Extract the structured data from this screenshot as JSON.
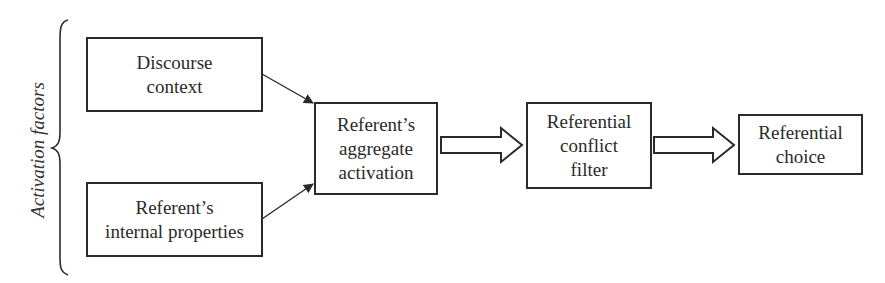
{
  "diagram": {
    "group_label": "Activation factors",
    "nodes": [
      {
        "id": "discourse",
        "label": "Discourse\ncontext"
      },
      {
        "id": "internal",
        "label": "Referent’s\ninternal properties"
      },
      {
        "id": "aggregate",
        "label": "Referent’s\naggregate\nactivation"
      },
      {
        "id": "filter",
        "label": "Referential\nconflict\nfilter"
      },
      {
        "id": "choice",
        "label": "Referential\nchoice"
      }
    ],
    "edges": [
      {
        "from": "discourse",
        "to": "aggregate",
        "style": "thin-arrow"
      },
      {
        "from": "internal",
        "to": "aggregate",
        "style": "thin-arrow"
      },
      {
        "from": "aggregate",
        "to": "filter",
        "style": "block-arrow"
      },
      {
        "from": "filter",
        "to": "choice",
        "style": "block-arrow"
      }
    ]
  }
}
